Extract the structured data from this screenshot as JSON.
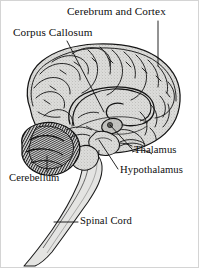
{
  "figure": {
    "view": "midsagittal section",
    "background_color": "#ffffff",
    "ink_color": "#0d0d0d",
    "tissue_fill": "#d8d8d6",
    "tissue_shade": "#b9b9b6",
    "border_color": "#c9c9c9"
  },
  "labels": {
    "cerebrum": "Cerebrum and Cortex",
    "corpus_callosum": "Corpus Callosum",
    "thalamus": "Thalamus",
    "hypothalamus": "Hypothalamus",
    "cerebellum": "Cerebellum",
    "spinal_cord": "Spinal Cord"
  },
  "structures": [
    {
      "name": "cerebrum-and-cortex",
      "label": "Cerebrum and Cortex",
      "leader": "vertical"
    },
    {
      "name": "corpus-callosum",
      "label": "Corpus Callosum",
      "leader": "diagonal-down-right"
    },
    {
      "name": "thalamus",
      "label": "Thalamus",
      "leader": "diagonal-up-left"
    },
    {
      "name": "hypothalamus",
      "label": "Hypothalamus",
      "leader": "diagonal-up-left"
    },
    {
      "name": "cerebellum",
      "label": "Cerebellum",
      "leader": "vertical-up"
    },
    {
      "name": "spinal-cord",
      "label": "Spinal Cord",
      "leader": "horizontal-left"
    }
  ]
}
